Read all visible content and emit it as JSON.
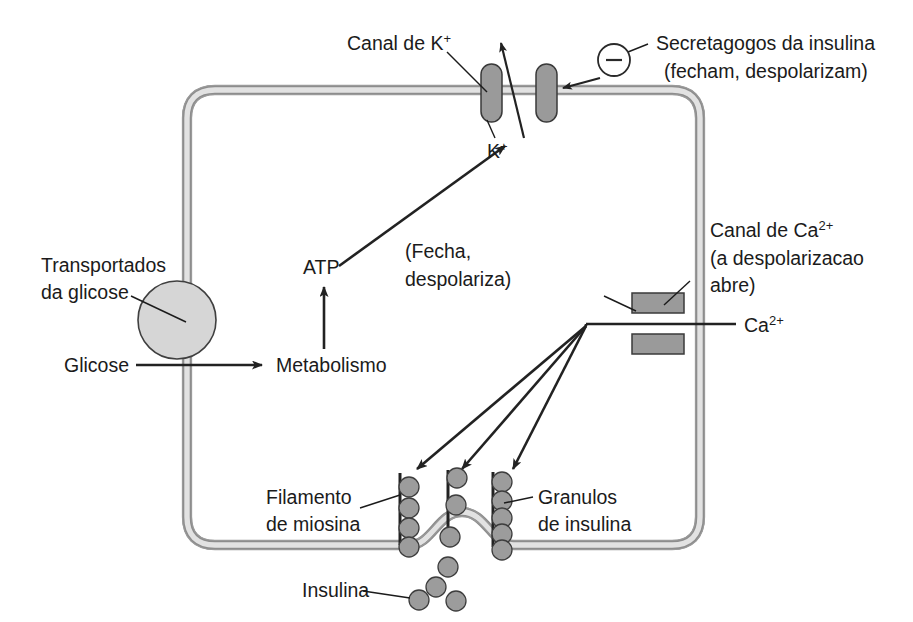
{
  "figure": {
    "background_color": "#ffffff",
    "ink_color": "#1b1b1b",
    "membrane_color": "#8d8d8d",
    "organelle_fill": "#9a9a9a"
  },
  "labels": {
    "potassium_channel": "Canal de K",
    "potassium_channel_sup": "+",
    "secretagogues_line1": "Secretagogos da insulina",
    "secretagogues_line2": "(fecham, despolarizam)",
    "potassium_ion": "K",
    "potassium_ion_sup": "+",
    "glucose_transporter_line1": "Transportados",
    "glucose_transporter_line2": "da glicose",
    "glucose": "Glicose",
    "metabolism": "Metabolismo",
    "atp": "ATP",
    "closes_line1": "(Fecha,",
    "closes_line2": "despolariza)",
    "calcium_channel_line1": "Canal de Ca",
    "calcium_channel_line1_sup": "2+",
    "calcium_channel_line2": "(a despolarizacao",
    "calcium_channel_line3": "abre)",
    "calcium_ion": "Ca",
    "calcium_ion_sup": "2+",
    "myosin_filament_line1": "Filamento",
    "myosin_filament_line2": "de miosina",
    "insulin_granules_line1": "Granulos",
    "insulin_granules_line2": "de insulina",
    "insulin": "Insulina",
    "minus_sign": "−"
  },
  "icons": {
    "minus_badge": "minus-circle-icon",
    "potassium_channel_icon": "ion-channel-icon",
    "calcium_channel_icon": "ion-channel-icon",
    "transporter_icon": "membrane-transporter-icon",
    "granule_icon": "vesicle-icon"
  },
  "diagram_data": {
    "type": "cell-signaling-diagram",
    "membrane_shape": "rounded-rectangle-with-exocytosis-bulge",
    "potassium_channel_count": 2,
    "calcium_channel_count": 1,
    "myosin_filament_count": 3,
    "granules_per_filament": [
      4,
      3,
      5
    ],
    "free_insulin_granule_count": 4,
    "flow_steps": [
      "Glicose",
      "Metabolismo",
      "ATP",
      "Canal de K+ (Fecha, despolariza)",
      "Canal de Ca2+ (a despolarizacao abre)",
      "Granulos de insulina",
      "Insulina"
    ]
  }
}
